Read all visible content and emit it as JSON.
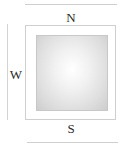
{
  "diagram": {
    "type": "compass-orientation",
    "labels": {
      "north": "N",
      "south": "S",
      "west": "W"
    },
    "colors": {
      "line": "#cfcfcf",
      "label": "#2a2a2a",
      "inner_fill_center": "#ffffff",
      "inner_fill_edge": "#cdcdcd"
    }
  }
}
